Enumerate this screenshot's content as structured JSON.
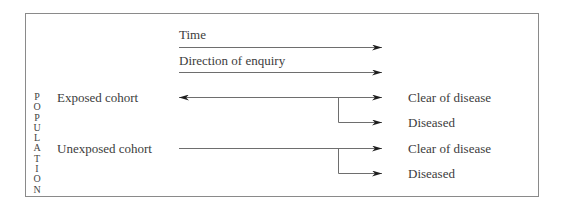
{
  "diagram": {
    "type": "cohort-study-flow",
    "side_label": "POPULATION",
    "side_label_letters": [
      "P",
      "O",
      "P",
      "U",
      "L",
      "A",
      "T",
      "I",
      "O",
      "N"
    ],
    "headers": {
      "time": "Time",
      "direction": "Direction of enquiry"
    },
    "cohorts": [
      {
        "label": "Exposed cohort",
        "arrow": "bidirectional",
        "outcomes": [
          "Clear of disease",
          "Diseased"
        ]
      },
      {
        "label": "Unexposed cohort",
        "arrow": "forward",
        "outcomes": [
          "Clear of disease",
          "Diseased"
        ]
      }
    ],
    "colors": {
      "line": "#6e6e6e",
      "arrowhead": "#1e1e1e",
      "border": "#8a8a8a",
      "text": "#3c3c3c"
    }
  }
}
